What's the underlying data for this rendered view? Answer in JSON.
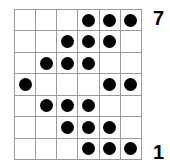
{
  "figure": {
    "title": "",
    "grid": {
      "columns": 6,
      "rows": 7,
      "line_color": "#9a9a9a",
      "cell_background": "#ffffff",
      "dot_color": "#000000"
    },
    "labels": {
      "top_right": "7",
      "bottom_right": "1"
    }
  },
  "chart_data": {
    "type": "heatmap",
    "title": "",
    "xlabel": "",
    "ylabel": "",
    "grid": true,
    "legend_position": "none",
    "columns": [
      1,
      2,
      3,
      4,
      5,
      6
    ],
    "rows": [
      7,
      6,
      5,
      4,
      3,
      2,
      1
    ],
    "row_labels_shown": [
      "7",
      "1"
    ],
    "annotations": [
      {
        "text": "7",
        "position": "top-right",
        "row": 1
      },
      {
        "text": "1",
        "position": "bottom-right",
        "row": 7
      }
    ],
    "cells": [
      [
        0,
        0,
        0,
        1,
        1,
        1
      ],
      [
        0,
        0,
        1,
        1,
        1,
        0
      ],
      [
        0,
        1,
        1,
        1,
        0,
        0
      ],
      [
        1,
        0,
        0,
        0,
        1,
        1
      ],
      [
        0,
        1,
        1,
        1,
        0,
        0
      ],
      [
        0,
        0,
        1,
        1,
        1,
        0
      ],
      [
        0,
        0,
        0,
        1,
        1,
        1
      ]
    ],
    "filled_counts_per_row": [
      3,
      3,
      3,
      3,
      3,
      3,
      3
    ],
    "filled_counts_per_column": [
      1,
      2,
      4,
      5,
      4,
      3
    ],
    "total_filled": 21,
    "total_cells": 42
  }
}
